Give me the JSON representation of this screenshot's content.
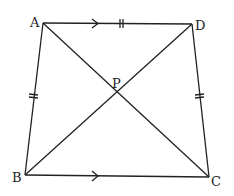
{
  "diagram": {
    "type": "quadrilateral",
    "points": {
      "A": {
        "label": "A",
        "x": 43,
        "y": 23
      },
      "D": {
        "label": "D",
        "x": 192,
        "y": 24
      },
      "B": {
        "label": "B",
        "x": 25,
        "y": 175
      },
      "C": {
        "label": "C",
        "x": 209,
        "y": 177
      },
      "P": {
        "label": "P",
        "x": 117,
        "y": 92
      }
    },
    "segments": [
      "AD",
      "BC",
      "AB",
      "DC",
      "AC",
      "BD"
    ],
    "marks": {
      "parallel_arrows": [
        "AD",
        "BC"
      ],
      "equal_ticks": [
        "AD",
        "AB",
        "DC"
      ]
    }
  }
}
